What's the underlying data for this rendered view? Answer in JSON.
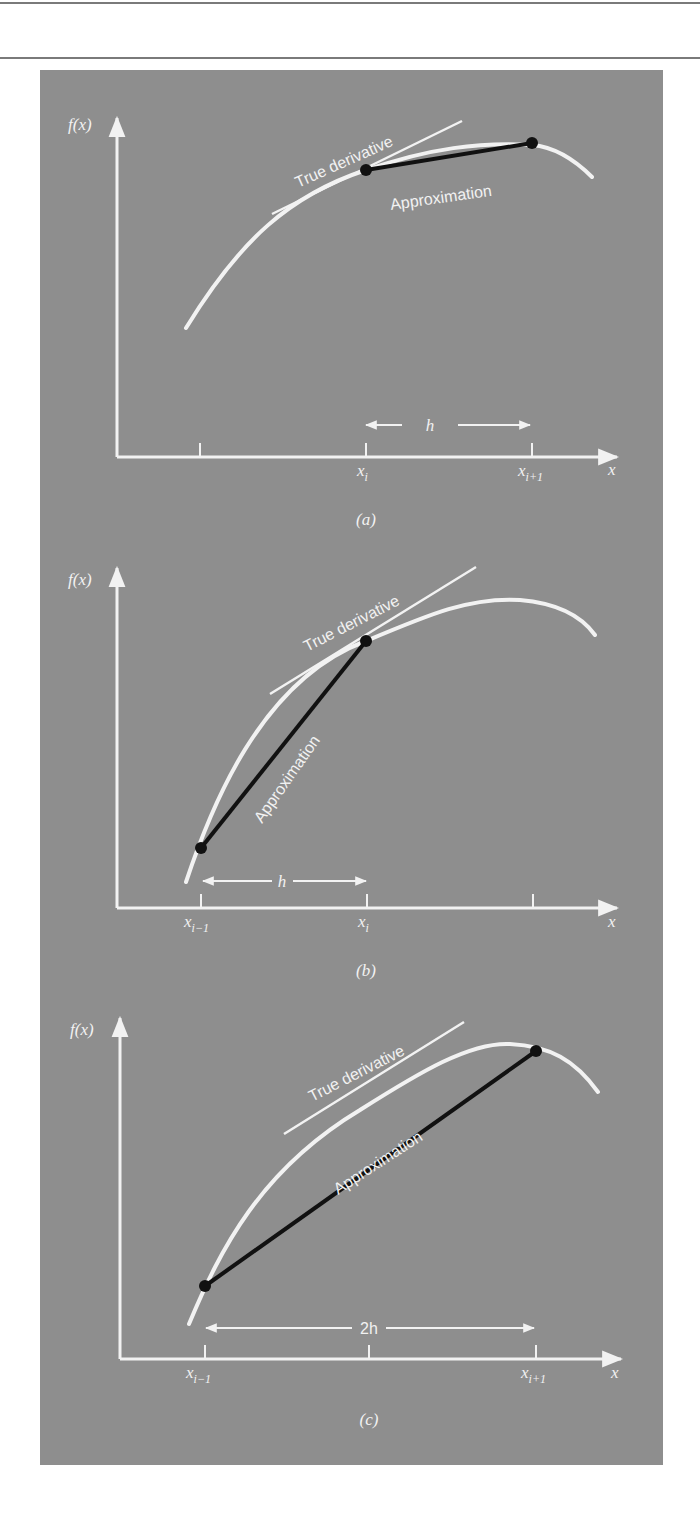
{
  "figure": {
    "panels": [
      {
        "id": "a",
        "caption": "(a)",
        "y_label": "f(x)",
        "x_label": "x",
        "ticks": [
          {
            "label": "",
            "sub": ""
          },
          {
            "label": "x",
            "sub": "i"
          },
          {
            "label": "x",
            "sub": "i+1"
          }
        ],
        "true_derivative_label": "True derivative",
        "approximation_label": "Approximation",
        "interval_label": "h",
        "method": "forward difference"
      },
      {
        "id": "b",
        "caption": "(b)",
        "y_label": "f(x)",
        "x_label": "x",
        "ticks": [
          {
            "label": "x",
            "sub": "i−1"
          },
          {
            "label": "x",
            "sub": "i"
          },
          {
            "label": "",
            "sub": ""
          }
        ],
        "true_derivative_label": "True derivative",
        "approximation_label": "Approximation",
        "interval_label": "h",
        "method": "backward difference"
      },
      {
        "id": "c",
        "caption": "(c)",
        "y_label": "f(x)",
        "x_label": "x",
        "ticks": [
          {
            "label": "x",
            "sub": "i−1"
          },
          {
            "label": "",
            "sub": ""
          },
          {
            "label": "x",
            "sub": "i+1"
          }
        ],
        "true_derivative_label": "True derivative",
        "approximation_label": "Approximation",
        "interval_label": "2h",
        "method": "centered difference"
      }
    ]
  },
  "colors": {
    "panel_background": "#8e8e8e",
    "curve": "#f2f2f2",
    "approximation_line": "#111111",
    "rule": "#7a7a7a"
  }
}
